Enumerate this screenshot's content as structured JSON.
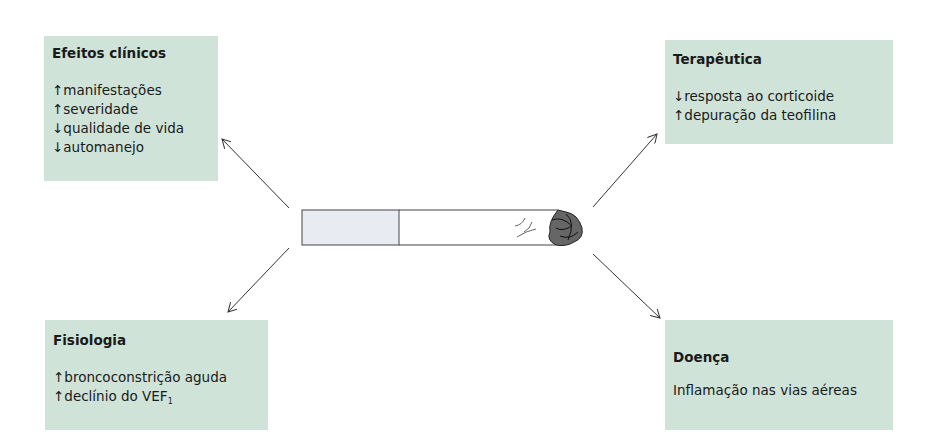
{
  "diagram": {
    "center": {
      "label": "cigarette",
      "filter_color": "#e8eaf0"
    },
    "box_color": "#cfe3d8",
    "boxes": {
      "efeitos": {
        "title": "Efeitos clínicos",
        "lines": [
          "↑manifestações",
          "↑severidade",
          "↓qualidade de vida",
          "↓automanejo"
        ]
      },
      "terapeutica": {
        "title": "Terapêutica",
        "lines": [
          "↓resposta ao corticoide",
          "↑depuração da teofilina"
        ]
      },
      "fisiologia": {
        "title": "Fisiologia",
        "lines": [
          "↑broncoconstrição aguda",
          "↑declínio do VEF"
        ],
        "subscript": "1"
      },
      "doenca": {
        "title": "Doença",
        "lines": [
          "Inflamação nas vias aéreas"
        ]
      }
    }
  }
}
